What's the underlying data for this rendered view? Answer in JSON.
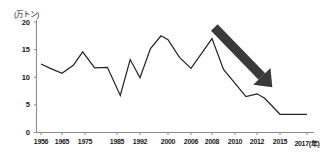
{
  "chart_data": {
    "type": "line",
    "title": "",
    "subtitle": "",
    "xlabel": "年",
    "ylabel": "万トン",
    "unit_label": "(万トン)",
    "xlim": [
      1956,
      2017
    ],
    "ylim": [
      0,
      20
    ],
    "grid": false,
    "legend": null,
    "y_ticks": [
      0,
      5,
      10,
      15,
      20
    ],
    "y_tick_labels": [
      "0",
      "5",
      "10",
      "15",
      "20"
    ],
    "x_ticks": [
      1956,
      1965,
      1975,
      1985,
      1992,
      2000,
      2006,
      2008,
      2010,
      2012,
      2015,
      2017
    ],
    "x_tick_labels": [
      "1956",
      "1965",
      "1975",
      "1985",
      "1992",
      "2000",
      "2006",
      "2008",
      "2010",
      "2012",
      "2015",
      "2017(年)"
    ],
    "line_color": "#262626",
    "axis_color": "#8c8c8c",
    "x": [
      1956,
      1960,
      1965,
      1970,
      1974,
      1978,
      1982,
      1986,
      1989,
      1992,
      1995,
      1998,
      2000,
      2003,
      2006,
      2008,
      2009,
      2011,
      2012,
      2013,
      2015,
      2017
    ],
    "values": [
      12.4,
      11.6,
      10.7,
      12.2,
      14.6,
      11.7,
      11.8,
      6.7,
      13.2,
      9.9,
      15.2,
      17.5,
      16.8,
      13.6,
      11.6,
      17.0,
      11.4,
      6.5,
      7.0,
      6.2,
      3.3,
      3.3
    ],
    "series": [
      {
        "name": "生産量",
        "values": [
          12.4,
          11.6,
          10.7,
          12.2,
          14.6,
          11.7,
          11.8,
          6.7,
          13.2,
          9.9,
          15.2,
          17.5,
          16.8,
          13.6,
          11.6,
          17.0,
          11.4,
          6.5,
          7.0,
          6.2,
          3.3,
          3.3
        ]
      }
    ],
    "annotations": [
      {
        "type": "arrow",
        "name": "decline-arrow",
        "color": "#3a3a3a",
        "from": [
          2008.2,
          19.0
        ],
        "to": [
          2014.0,
          8.2
        ],
        "description": "thick diagonal arrow pointing down-right indicating decline"
      }
    ]
  }
}
